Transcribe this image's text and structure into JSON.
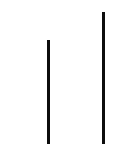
{
  "canvas": {
    "width": 129,
    "height": 147,
    "background_color": "#ffffff"
  },
  "chart_data": {
    "type": "bar",
    "title": "",
    "subtitle": "",
    "xlabel": "",
    "ylabel": "",
    "categories": [
      "",
      ""
    ],
    "values": [
      104,
      132
    ],
    "ylim": [
      0,
      147
    ],
    "xlim": [
      0,
      129
    ],
    "grid": false,
    "legend": null,
    "legend_position": "none",
    "tick_labels_x": [],
    "tick_labels_y": [],
    "annotations": [],
    "bar_color": "#0d0d0d",
    "bar_width_px": 3,
    "bars": [
      {
        "name": "left-bar",
        "x_px": 47,
        "top_px": 40,
        "bottom_px": 144,
        "width_px": 3,
        "height_px": 104,
        "color": "#0d0d0d"
      },
      {
        "name": "right-bar",
        "x_px": 102,
        "top_px": 12,
        "bottom_px": 144,
        "width_px": 3,
        "height_px": 132,
        "color": "#0d0d0d"
      }
    ]
  }
}
